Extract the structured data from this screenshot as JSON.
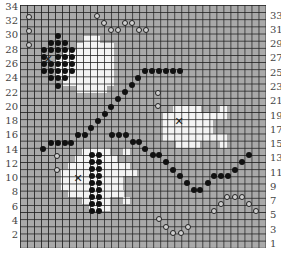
{
  "board": {
    "origin": [
      20,
      5
    ],
    "cols": 35,
    "rows": 34,
    "colors": {
      "background": "#a9a9a9",
      "highlight": "#f4f4f4",
      "grid": "#1e1e1e",
      "stone": "#111111"
    }
  },
  "labels": {
    "left": [
      {
        "text": "34",
        "y": 2
      },
      {
        "text": "32",
        "y": 16
      },
      {
        "text": "30",
        "y": 30
      },
      {
        "text": "28",
        "y": 45
      },
      {
        "text": "26",
        "y": 59
      },
      {
        "text": "24",
        "y": 73
      },
      {
        "text": "22",
        "y": 88
      },
      {
        "text": "20",
        "y": 102
      },
      {
        "text": "18",
        "y": 116
      },
      {
        "text": "16",
        "y": 130
      },
      {
        "text": "14",
        "y": 145
      },
      {
        "text": "12",
        "y": 159
      },
      {
        "text": "10",
        "y": 173
      },
      {
        "text": "8",
        "y": 187
      },
      {
        "text": "6",
        "y": 202
      },
      {
        "text": "4",
        "y": 216
      },
      {
        "text": "2",
        "y": 230
      }
    ],
    "right": [
      {
        "text": "33",
        "y": 11
      },
      {
        "text": "31",
        "y": 25
      },
      {
        "text": "29",
        "y": 39
      },
      {
        "text": "27",
        "y": 53
      },
      {
        "text": "25",
        "y": 68
      },
      {
        "text": "23",
        "y": 82
      },
      {
        "text": "21",
        "y": 96
      },
      {
        "text": "19",
        "y": 111
      },
      {
        "text": "17",
        "y": 125
      },
      {
        "text": "15",
        "y": 139
      },
      {
        "text": "13",
        "y": 153
      },
      {
        "text": "11",
        "y": 168
      },
      {
        "text": "9",
        "y": 182
      },
      {
        "text": "7",
        "y": 196
      },
      {
        "text": "5",
        "y": 210
      },
      {
        "text": "3",
        "y": 225
      },
      {
        "text": "1",
        "y": 239
      }
    ]
  },
  "white_regions": [
    {
      "name": "fish-top-left",
      "rects": [
        [
          83,
          36,
          17,
          7
        ],
        [
          76,
          43,
          31,
          50
        ],
        [
          62,
          50,
          14,
          36
        ],
        [
          55,
          57,
          7,
          22
        ],
        [
          107,
          43,
          7,
          43
        ],
        [
          83,
          86,
          21,
          7
        ]
      ]
    },
    {
      "name": "fish-right",
      "rects": [
        [
          173,
          106,
          28,
          7
        ],
        [
          220,
          106,
          7,
          7
        ],
        [
          163,
          113,
          64,
          7
        ],
        [
          163,
          120,
          50,
          14
        ],
        [
          163,
          134,
          64,
          7
        ],
        [
          176,
          141,
          24,
          7
        ],
        [
          220,
          141,
          7,
          7
        ]
      ]
    },
    {
      "name": "fish-bottom",
      "rects": [
        [
          82,
          148,
          28,
          7
        ],
        [
          123,
          148,
          7,
          7
        ],
        [
          75,
          155,
          42,
          7
        ],
        [
          68,
          162,
          62,
          14
        ],
        [
          61,
          169,
          76,
          7
        ],
        [
          61,
          176,
          62,
          14
        ],
        [
          68,
          190,
          56,
          7
        ],
        [
          82,
          197,
          28,
          7
        ],
        [
          123,
          197,
          7,
          7
        ],
        [
          89,
          204,
          21,
          7
        ]
      ]
    }
  ],
  "x_marks": [
    {
      "x": 48,
      "y": 59
    },
    {
      "x": 179,
      "y": 121
    },
    {
      "x": 78,
      "y": 178
    }
  ],
  "black_stones": [
    [
      58,
      36
    ],
    [
      51,
      43
    ],
    [
      58,
      43
    ],
    [
      65,
      43
    ],
    [
      44,
      50
    ],
    [
      51,
      50
    ],
    [
      58,
      50
    ],
    [
      65,
      50
    ],
    [
      72,
      50
    ],
    [
      44,
      57
    ],
    [
      58,
      57
    ],
    [
      65,
      57
    ],
    [
      72,
      57
    ],
    [
      44,
      64
    ],
    [
      51,
      64
    ],
    [
      58,
      64
    ],
    [
      65,
      64
    ],
    [
      72,
      64
    ],
    [
      44,
      71
    ],
    [
      51,
      71
    ],
    [
      58,
      71
    ],
    [
      65,
      71
    ],
    [
      72,
      71
    ],
    [
      51,
      78
    ],
    [
      58,
      78
    ],
    [
      65,
      78
    ],
    [
      58,
      86
    ],
    [
      92,
      155
    ],
    [
      99,
      155
    ],
    [
      92,
      162
    ],
    [
      99,
      162
    ],
    [
      92,
      169
    ],
    [
      99,
      169
    ],
    [
      92,
      176
    ],
    [
      99,
      176
    ],
    [
      92,
      183
    ],
    [
      99,
      183
    ],
    [
      92,
      190
    ],
    [
      99,
      190
    ],
    [
      92,
      197
    ],
    [
      99,
      197
    ],
    [
      92,
      204
    ],
    [
      99,
      204
    ],
    [
      92,
      211
    ],
    [
      99,
      211
    ],
    [
      43,
      149
    ],
    [
      51,
      143
    ],
    [
      58,
      143
    ],
    [
      65,
      143
    ],
    [
      71,
      143
    ],
    [
      78,
      135
    ],
    [
      85,
      135
    ],
    [
      91,
      128
    ],
    [
      98,
      121
    ],
    [
      105,
      114
    ],
    [
      111,
      107
    ],
    [
      118,
      99
    ],
    [
      125,
      92
    ],
    [
      132,
      85
    ],
    [
      138,
      78
    ],
    [
      145,
      71
    ],
    [
      152,
      71
    ],
    [
      159,
      71
    ],
    [
      166,
      71
    ],
    [
      173,
      71
    ],
    [
      180,
      71
    ],
    [
      112,
      135
    ],
    [
      119,
      135
    ],
    [
      126,
      135
    ],
    [
      133,
      142
    ],
    [
      139,
      142
    ],
    [
      145,
      149
    ],
    [
      153,
      155
    ],
    [
      159,
      155
    ],
    [
      166,
      162
    ],
    [
      173,
      170
    ],
    [
      180,
      176
    ],
    [
      187,
      183
    ],
    [
      194,
      190
    ],
    [
      200,
      190
    ],
    [
      208,
      183
    ],
    [
      214,
      176
    ],
    [
      221,
      176
    ],
    [
      228,
      176
    ],
    [
      235,
      170
    ],
    [
      242,
      162
    ],
    [
      249,
      155
    ]
  ],
  "open_circles": [
    [
      29,
      17
    ],
    [
      29,
      31
    ],
    [
      29,
      45
    ],
    [
      97,
      16
    ],
    [
      104,
      23
    ],
    [
      111,
      30
    ],
    [
      118,
      30
    ],
    [
      125,
      23
    ],
    [
      132,
      23
    ],
    [
      139,
      30
    ],
    [
      146,
      30
    ],
    [
      158,
      93
    ],
    [
      158,
      106
    ],
    [
      57,
      156
    ],
    [
      57,
      170
    ],
    [
      227,
      197
    ],
    [
      235,
      197
    ],
    [
      242,
      197
    ],
    [
      221,
      204
    ],
    [
      249,
      204
    ],
    [
      214,
      211
    ],
    [
      256,
      211
    ],
    [
      159,
      219
    ],
    [
      166,
      227
    ],
    [
      173,
      233
    ],
    [
      181,
      233
    ],
    [
      188,
      227
    ]
  ]
}
